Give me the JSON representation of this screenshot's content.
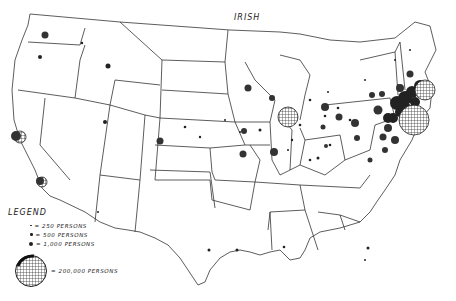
{
  "title": "IRISH",
  "legend": {
    "heading": "LEGEND",
    "items": [
      {
        "label": "= 250 PERSONS",
        "persons": 250
      },
      {
        "label": "= 500 PERSONS",
        "persons": 500
      },
      {
        "label": "= 1,000 PERSONS",
        "persons": 1000
      }
    ],
    "large": {
      "label": "= 200,000 PERSONS",
      "persons": 200000
    }
  },
  "colors": {
    "ink": "#222222",
    "background": "#ffffff"
  }
}
